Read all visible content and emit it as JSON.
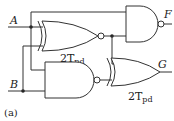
{
  "inputs": {
    "a": "A",
    "b": "B"
  },
  "outputs": {
    "f": "F",
    "g": "G"
  },
  "gates": {
    "xnor": {
      "type": "XNOR",
      "delay_main": "2T",
      "delay_sub": "pd"
    },
    "nand_f": {
      "type": "NAND"
    },
    "nand_b": {
      "type": "NAND"
    },
    "xor_g": {
      "type": "XOR",
      "delay_main": "2T",
      "delay_sub": "pd"
    }
  },
  "caption": "(a)",
  "colors": {
    "line": "#333333",
    "background": "#ffffff"
  }
}
